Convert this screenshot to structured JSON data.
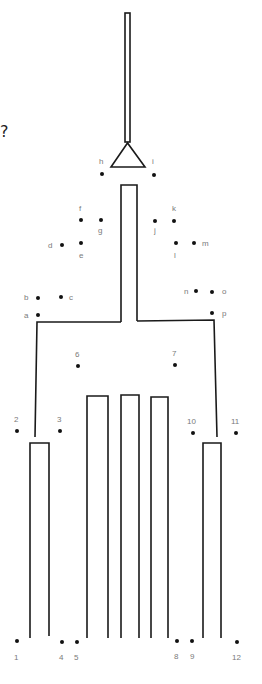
{
  "worksheet": {
    "title_mark": "?",
    "colors": {
      "line": "#1a1a1a",
      "dot": "#111111",
      "label": "#7a7a7a",
      "background": "#ffffff"
    },
    "letter_dots": [
      {
        "label": "a",
        "x": 38,
        "y": 315,
        "lx": 24,
        "ly": 318
      },
      {
        "label": "b",
        "x": 38,
        "y": 298,
        "lx": 24,
        "ly": 300
      },
      {
        "label": "c",
        "x": 61,
        "y": 297,
        "lx": 69,
        "ly": 300
      },
      {
        "label": "d",
        "x": 62,
        "y": 245,
        "lx": 48,
        "ly": 248
      },
      {
        "label": "e",
        "x": 81,
        "y": 243,
        "lx": 79,
        "ly": 258
      },
      {
        "label": "f",
        "x": 81,
        "y": 220,
        "lx": 79,
        "ly": 211
      },
      {
        "label": "g",
        "x": 101,
        "y": 220,
        "lx": 98,
        "ly": 233
      },
      {
        "label": "h",
        "x": 102,
        "y": 174,
        "lx": 99,
        "ly": 164
      },
      {
        "label": "i",
        "x": 154,
        "y": 175,
        "lx": 152,
        "ly": 164
      },
      {
        "label": "j",
        "x": 155,
        "y": 221,
        "lx": 154,
        "ly": 233
      },
      {
        "label": "k",
        "x": 174,
        "y": 221,
        "lx": 172,
        "ly": 211
      },
      {
        "label": "l",
        "x": 176,
        "y": 243,
        "lx": 174,
        "ly": 258
      },
      {
        "label": "m",
        "x": 194,
        "y": 243,
        "lx": 202,
        "ly": 246
      },
      {
        "label": "n",
        "x": 196,
        "y": 291,
        "lx": 184,
        "ly": 294
      },
      {
        "label": "o",
        "x": 212,
        "y": 292,
        "lx": 222,
        "ly": 294
      },
      {
        "label": "p",
        "x": 212,
        "y": 313,
        "lx": 222,
        "ly": 316
      }
    ],
    "number_dots": [
      {
        "label": "1",
        "x": 17,
        "y": 641,
        "lx": 14,
        "ly": 660
      },
      {
        "label": "2",
        "x": 17,
        "y": 431,
        "lx": 14,
        "ly": 422
      },
      {
        "label": "3",
        "x": 60,
        "y": 431,
        "lx": 57,
        "ly": 422
      },
      {
        "label": "4",
        "x": 62,
        "y": 642,
        "lx": 59,
        "ly": 660
      },
      {
        "label": "5",
        "x": 77,
        "y": 642,
        "lx": 74,
        "ly": 660
      },
      {
        "label": "6",
        "x": 78,
        "y": 366,
        "lx": 75,
        "ly": 357
      },
      {
        "label": "7",
        "x": 175,
        "y": 365,
        "lx": 172,
        "ly": 356
      },
      {
        "label": "8",
        "x": 177,
        "y": 641,
        "lx": 174,
        "ly": 659
      },
      {
        "label": "9",
        "x": 192,
        "y": 641,
        "lx": 190,
        "ly": 659
      },
      {
        "label": "10",
        "x": 193,
        "y": 433,
        "lx": 187,
        "ly": 424
      },
      {
        "label": "11",
        "x": 236,
        "y": 433,
        "lx": 231,
        "ly": 424
      },
      {
        "label": "12",
        "x": 237,
        "y": 642,
        "lx": 232,
        "ly": 660
      }
    ]
  }
}
